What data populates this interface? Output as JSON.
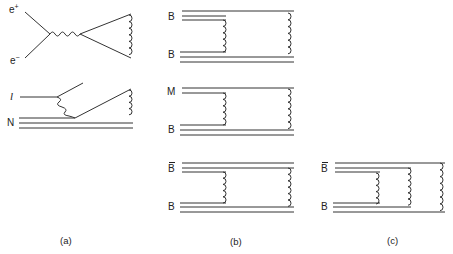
{
  "figure": {
    "panel_a": {
      "caption": "(a)",
      "annihilation": {
        "positron_label": "e",
        "positron_sup": "+",
        "electron_label": "e",
        "electron_sup": "−"
      },
      "dis": {
        "lepton_label": "l",
        "nucleon_label": "N"
      }
    },
    "panel_b": {
      "caption": "(b)",
      "diagrams": [
        {
          "top_label": "B",
          "top_bar": false,
          "bottom_label": "B"
        },
        {
          "top_label": "M",
          "top_bar": false,
          "bottom_label": "B"
        },
        {
          "top_label": "B",
          "top_bar": true,
          "bottom_label": "B"
        }
      ]
    },
    "panel_c": {
      "caption": "(c)",
      "top_label": "B",
      "top_bar": true,
      "bottom_label": "B"
    }
  }
}
